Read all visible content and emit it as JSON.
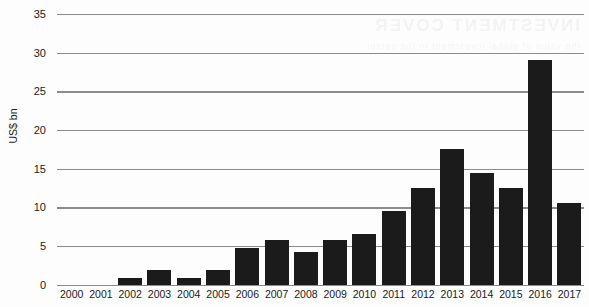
{
  "chart_data": {
    "type": "bar",
    "title": "",
    "subtitle": "",
    "xlabel": "",
    "ylabel": "US$ bn",
    "categories": [
      "2000",
      "2001",
      "2002",
      "2003",
      "2004",
      "2005",
      "2006",
      "2007",
      "2008",
      "2009",
      "2010",
      "2011",
      "2012",
      "2013",
      "2014",
      "2015",
      "2016",
      "2017"
    ],
    "values": [
      0,
      0,
      1,
      2,
      1,
      2,
      5,
      6,
      4.5,
      6,
      6.8,
      10,
      13,
      18.3,
      15.1,
      13,
      30.2,
      11
    ],
    "ylim": [
      0,
      35
    ],
    "yticks": [
      0,
      5,
      10,
      15,
      20,
      25,
      30,
      35
    ],
    "ytick_labels": [
      "0",
      "5",
      "10",
      "15",
      "20",
      "25",
      "30",
      "35"
    ],
    "grid": true,
    "legend": null,
    "legend_position": "none",
    "series": [
      {
        "name": "US$ bn",
        "values": [
          0,
          0,
          1,
          2,
          1,
          2,
          5,
          6,
          4.5,
          6,
          6.8,
          10,
          13,
          18.3,
          15.1,
          13,
          30.2,
          11
        ]
      }
    ],
    "annotations": []
  },
  "colors": {
    "bar": "#1b1b1b",
    "gridline": "#8c8c8c",
    "text": "#1a1a1a",
    "background": "#fdfdfd"
  },
  "artifacts": {
    "watermark_line1": "INVESTMENT COVER",
    "watermark_line2": "the value of global investment in the sector"
  }
}
